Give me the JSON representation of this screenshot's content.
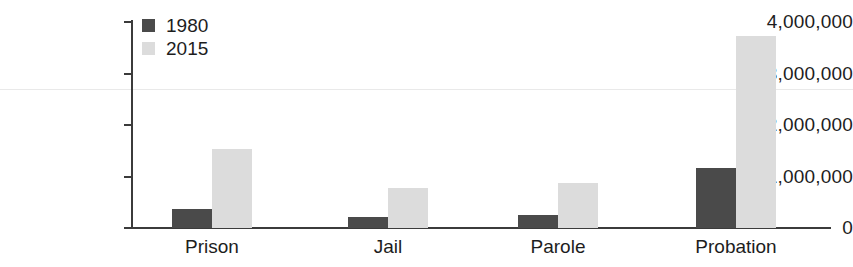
{
  "chart_data": {
    "type": "bar",
    "title": "",
    "subtitle": "",
    "xlabel": "",
    "ylabel": "",
    "categories": [
      "Prison",
      "Jail",
      "Parole",
      "Probation"
    ],
    "series": [
      {
        "name": "1980",
        "color": "#4a4a4a",
        "values": [
          370000,
          220000,
          250000,
          1170000
        ]
      },
      {
        "name": "2015",
        "color": "#dcdcdc",
        "values": [
          1530000,
          780000,
          870000,
          3730000
        ]
      }
    ],
    "ylim": [
      0,
      4000000
    ],
    "ytick_values": [
      0,
      1000000,
      2000000,
      3000000,
      4000000
    ],
    "ytick_labels": [
      "0",
      "1,000,000",
      "2,000,000",
      "3,000,000",
      "4,000,000"
    ],
    "grid": false,
    "legend_position": "top-left-inside",
    "legend_entries": [
      {
        "label": "1980",
        "color": "#4a4a4a"
      },
      {
        "label": "2015",
        "color": "#dcdcdc"
      }
    ],
    "axis_color": "#3b3b3b"
  }
}
